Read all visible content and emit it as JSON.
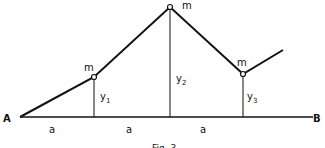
{
  "diagram": {
    "labels": {
      "left_end": "A",
      "right_end": "B",
      "mass1": "m",
      "mass2": "m",
      "mass3": "m",
      "y1": "y",
      "y1_sub": "1",
      "y2": "y",
      "y2_sub": "2",
      "y3": "y",
      "y3_sub": "3",
      "spacing1": "a",
      "spacing2": "a",
      "spacing3": "a",
      "caption": "Fig. 3"
    },
    "colors": {
      "line": "#111111",
      "background": "#ffffff"
    }
  }
}
